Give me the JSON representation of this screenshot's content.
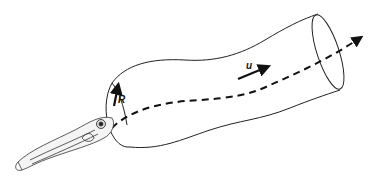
{
  "diagram": {
    "labels": {
      "radius": "R",
      "velocity": "u"
    },
    "elements": [
      "fish-larva",
      "tube-cylinder",
      "flow-path-dashed",
      "radius-arrow",
      "velocity-arrow"
    ],
    "colors": {
      "stroke": "#111111",
      "background": "#ffffff"
    }
  }
}
